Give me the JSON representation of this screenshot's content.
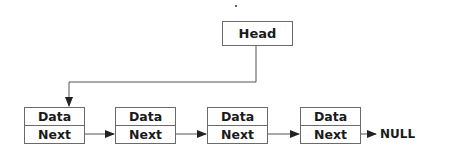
{
  "diagram": {
    "head": {
      "label": "Head"
    },
    "nodes": [
      {
        "data_label": "Data",
        "next_label": "Next"
      },
      {
        "data_label": "Data",
        "next_label": "Next"
      },
      {
        "data_label": "Data",
        "next_label": "Next"
      },
      {
        "data_label": "Data",
        "next_label": "Next"
      }
    ],
    "terminal": {
      "label": "NULL"
    },
    "colors": {
      "line": "#555555",
      "border": "#6a6a6a",
      "text": "#1a1a1a",
      "background": "#ffffff"
    }
  }
}
